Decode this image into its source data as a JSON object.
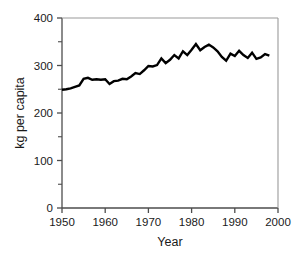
{
  "chart_data": {
    "type": "line",
    "title": "",
    "subtitle": "",
    "xlabel": "Year",
    "ylabel": "kg per capita",
    "xlim": [
      1950,
      2000
    ],
    "ylim": [
      0,
      400
    ],
    "xticks": [
      1950,
      1960,
      1970,
      1980,
      1990,
      2000
    ],
    "xtick_labels": [
      "1950",
      "1960",
      "1970",
      "1980",
      "1990",
      "2000"
    ],
    "yticks": [
      0,
      100,
      200,
      300,
      400
    ],
    "ytick_labels": [
      "0",
      "100",
      "200",
      "300",
      "400"
    ],
    "y_minor_ticks": [
      50,
      150,
      250,
      350
    ],
    "grid": false,
    "legend": null,
    "legend_position": "none",
    "line_color": "#000000",
    "line_width": 2.4,
    "series": [
      {
        "name": "kg per capita",
        "x": [
          1950,
          1951,
          1952,
          1953,
          1954,
          1955,
          1956,
          1957,
          1958,
          1959,
          1960,
          1961,
          1962,
          1963,
          1964,
          1965,
          1966,
          1967,
          1968,
          1969,
          1970,
          1971,
          1972,
          1973,
          1974,
          1975,
          1976,
          1977,
          1978,
          1979,
          1980,
          1981,
          1982,
          1983,
          1984,
          1985,
          1986,
          1987,
          1988,
          1989,
          1990,
          1991,
          1992,
          1993,
          1994,
          1995,
          1996,
          1997,
          1998
        ],
        "values": [
          249,
          250,
          252,
          255,
          258,
          272,
          274,
          270,
          271,
          270,
          271,
          261,
          267,
          268,
          272,
          271,
          277,
          284,
          282,
          290,
          299,
          298,
          301,
          315,
          305,
          312,
          322,
          315,
          330,
          322,
          333,
          345,
          332,
          339,
          344,
          338,
          330,
          318,
          310,
          325,
          320,
          331,
          322,
          316,
          327,
          314,
          317,
          324,
          321
        ]
      }
    ]
  },
  "figure": {
    "xlabel": "Year",
    "ylabel": "kg per capita"
  }
}
